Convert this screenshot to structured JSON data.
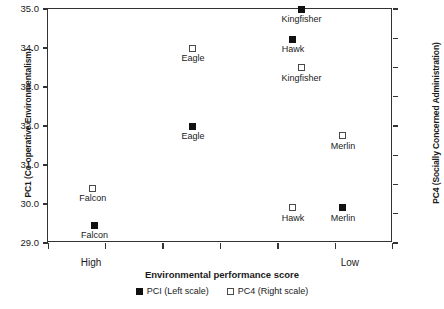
{
  "chart_data": {
    "type": "scatter",
    "title": "",
    "xlabel": "Environmental performance score",
    "ylabel": "PC1 (Co-operative Environmentalism)",
    "y2label": "PC4 (Socially Concerned Administration)",
    "xlim_labels": [
      "High",
      "Low"
    ],
    "x_tick_count": 7,
    "grid": false,
    "ylim": [
      29.0,
      35.0
    ],
    "y_ticks": [
      "29.0",
      "30.0",
      "31.0",
      "32.0",
      "33.0",
      "34.0",
      "35.0"
    ],
    "y2lim": [
      -1,
      3
    ],
    "y2_ticks": [
      "-1",
      "-0.5",
      "0",
      "0.5",
      "1",
      "1.5",
      "2",
      "2.5",
      "3"
    ],
    "legend": {
      "position": "bottom-center",
      "entries": [
        {
          "marker": "filled-square",
          "label": "PCI (Left scale)"
        },
        {
          "marker": "open-square",
          "label": "PC4 (Right scale)"
        }
      ]
    },
    "series": [
      {
        "name": "PCI (Left scale)",
        "marker": "filled-square",
        "points": [
          {
            "label": "Falcon",
            "x_pct": 13.5,
            "y_left": 29.45
          },
          {
            "label": "Eagle",
            "x_pct": 42.0,
            "y_left": 32.0
          },
          {
            "label": "Hawk",
            "x_pct": 71.0,
            "y_left": 34.22
          },
          {
            "label": "Kingfisher",
            "x_pct": 73.5,
            "y_left": 35.0
          },
          {
            "label": "Merlin",
            "x_pct": 85.5,
            "y_left": 29.9
          }
        ]
      },
      {
        "name": "PC4 (Right scale)",
        "marker": "open-square",
        "points": [
          {
            "label": "Falcon",
            "x_pct": 13.0,
            "y_left": 30.4,
            "y_right": -0.07
          },
          {
            "label": "Eagle",
            "x_pct": 42.0,
            "y_left": 34.0,
            "y_right": 2.33
          },
          {
            "label": "Kingfisher",
            "x_pct": 73.5,
            "y_left": 33.5,
            "y_right": 2.0
          },
          {
            "label": "Hawk",
            "x_pct": 71.0,
            "y_left": 29.9,
            "y_right": -0.4
          },
          {
            "label": "Merlin",
            "x_pct": 85.5,
            "y_left": 31.75,
            "y_right": 0.83
          }
        ]
      }
    ]
  },
  "axes": {
    "left": {
      "title": "PC1 (Co-operative Environmentalism)",
      "ticks": [
        {
          "value": 35.0,
          "label": "35.0"
        },
        {
          "value": 34.0,
          "label": "34.0"
        },
        {
          "value": 33.0,
          "label": "33.0"
        },
        {
          "value": 32.0,
          "label": "32.0"
        },
        {
          "value": 31.0,
          "label": "31.0"
        },
        {
          "value": 30.0,
          "label": "30.0"
        },
        {
          "value": 29.0,
          "label": "29.0"
        }
      ]
    },
    "right": {
      "title": "PC4 (Socially Concerned Administration)",
      "ticks": [
        {
          "value": 3,
          "label": "3"
        },
        {
          "value": 2.5,
          "label": "2.5"
        },
        {
          "value": 2,
          "label": "2"
        },
        {
          "value": 1.5,
          "label": "1.5"
        },
        {
          "value": 1,
          "label": "1"
        },
        {
          "value": 0.5,
          "label": "0.5"
        },
        {
          "value": 0,
          "label": "0"
        },
        {
          "value": -0.5,
          "label": "-0.5"
        },
        {
          "value": -1,
          "label": "-1"
        }
      ]
    },
    "bottom": {
      "title": "Environmental performance score",
      "low_end_label": "High",
      "high_end_label": "Low"
    }
  },
  "legend": {
    "pc1_label": "PCI (Left scale)",
    "pc4_label": "PC4 (Right scale)"
  }
}
